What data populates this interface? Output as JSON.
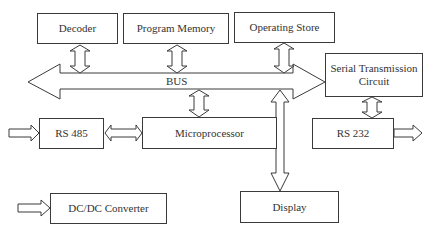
{
  "diagram": {
    "title": "",
    "colors": {
      "stroke": "#3a3a3a",
      "text": "#333333",
      "background": "#ffffff"
    },
    "blocks": {
      "decoder": {
        "label": "Decoder",
        "x": 37,
        "y": 13,
        "w": 81,
        "h": 31
      },
      "program_memory": {
        "label": "Program Memory",
        "x": 123,
        "y": 13,
        "w": 106,
        "h": 31
      },
      "operating_store": {
        "label": "Operating Store",
        "x": 234,
        "y": 12,
        "w": 101,
        "h": 31
      },
      "serial_transmission": {
        "label": "Serial Transmission Circuit",
        "x": 325,
        "y": 53,
        "w": 98,
        "h": 44
      },
      "rs485": {
        "label": "RS 485",
        "x": 39,
        "y": 118,
        "w": 65,
        "h": 31
      },
      "microprocessor": {
        "label": "Microprocessor",
        "x": 142,
        "y": 117,
        "w": 135,
        "h": 32
      },
      "rs232": {
        "label": "RS 232",
        "x": 312,
        "y": 118,
        "w": 81,
        "h": 31
      },
      "dcdc_converter": {
        "label": "DC/DC Converter",
        "x": 50,
        "y": 193,
        "w": 117,
        "h": 31
      },
      "display": {
        "label": "Display",
        "x": 240,
        "y": 191,
        "w": 99,
        "h": 32
      }
    },
    "bus": {
      "label": "BUS"
    },
    "connections": [
      {
        "from": "decoder",
        "to": "bus",
        "type": "bidirectional"
      },
      {
        "from": "program_memory",
        "to": "bus",
        "type": "bidirectional"
      },
      {
        "from": "operating_store",
        "to": "bus",
        "type": "bidirectional"
      },
      {
        "from": "bus",
        "to": "microprocessor",
        "type": "bidirectional"
      },
      {
        "from": "bus",
        "to": "display",
        "type": "unidirectional"
      },
      {
        "from": "serial_transmission",
        "to": "rs232",
        "type": "bidirectional"
      },
      {
        "from": "rs485",
        "to": "microprocessor",
        "type": "bidirectional"
      },
      {
        "from": "external",
        "to": "rs485",
        "type": "input"
      },
      {
        "from": "rs232",
        "to": "external",
        "type": "output"
      },
      {
        "from": "external",
        "to": "dcdc_converter",
        "type": "input"
      }
    ]
  }
}
